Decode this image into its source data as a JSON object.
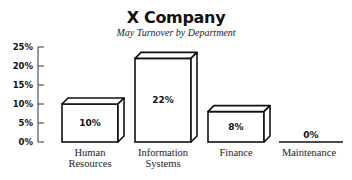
{
  "chart_data": {
    "type": "bar",
    "style": "3d",
    "title": "X Company",
    "subtitle": "May Turnover by Department",
    "xlabel": "",
    "ylabel": "",
    "ylim": [
      0,
      25
    ],
    "yticks": [
      "0%",
      "5%",
      "10%",
      "15%",
      "20%",
      "25%"
    ],
    "categories": [
      "Human Resources",
      "Information Systems",
      "Finance",
      "Maintenance"
    ],
    "category_lines": [
      [
        "Human",
        "Resources"
      ],
      [
        "Information",
        "Systems"
      ],
      [
        "Finance"
      ],
      [
        "Maintenance"
      ]
    ],
    "values": [
      10,
      22,
      8,
      0
    ],
    "value_labels": [
      "10%",
      "22%",
      "8%",
      "0%"
    ],
    "grid": false,
    "legend": null
  },
  "colors": {
    "bar_fill": "#ffffff",
    "bar_stroke": "#111111",
    "axis": "#333333",
    "text": "#111111"
  }
}
